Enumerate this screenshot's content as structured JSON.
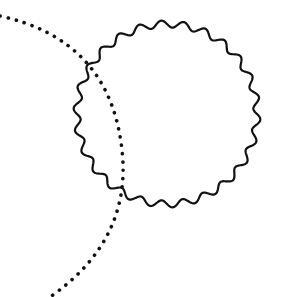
{
  "figure": {
    "background": "#ffffff",
    "stroke_color": "#111111",
    "shapes": [
      {
        "kind": "wavy-circle",
        "label": "wavy circle",
        "center": [
          167,
          114
        ],
        "radius": 90,
        "waves": 26,
        "amplitude": 3.5
      },
      {
        "kind": "dotted-arc",
        "label": "dotted arc",
        "path": "M 0 16 Q 110 40 122 150 Q 132 240 50 297"
      }
    ]
  }
}
